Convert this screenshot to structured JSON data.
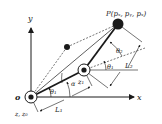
{
  "diagram": {
    "axes": {
      "x_label": "x",
      "y_label": "y",
      "origin_label": "o"
    },
    "base_joint": {
      "label": "z, z₀"
    },
    "elbow_joint": {
      "label": "z₁"
    },
    "end_effector": {
      "label": "P(pₓ, pᵧ, pₓ)",
      "label_parts": [
        "P(",
        "p",
        "x",
        ", ",
        "p",
        "y",
        ", ",
        "p",
        "z",
        ")"
      ]
    },
    "angles": {
      "theta1_base": "θ₁",
      "alpha": "α",
      "theta1_elbow": "θ₁",
      "theta2": "θ₂"
    },
    "lengths": {
      "L1": "L₁",
      "L2": "L₂"
    },
    "colors": {
      "stroke": "#1a1a1a",
      "background": "#ffffff"
    }
  }
}
